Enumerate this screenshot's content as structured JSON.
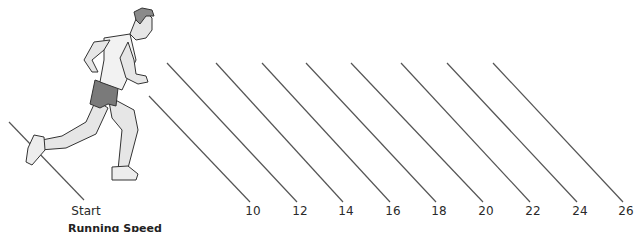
{
  "figure": {
    "caption": "Running Speed",
    "start_label": "Start",
    "markers": [
      {
        "label": "10",
        "x": 253
      },
      {
        "label": "12",
        "x": 300
      },
      {
        "label": "14",
        "x": 346
      },
      {
        "label": "16",
        "x": 393
      },
      {
        "label": "18",
        "x": 439
      },
      {
        "label": "20",
        "x": 486
      },
      {
        "label": "22",
        "x": 533
      },
      {
        "label": "24",
        "x": 580
      },
      {
        "label": "26",
        "x": 626
      }
    ],
    "line_color": "#555555",
    "figure_fill": "#e6e6e6",
    "shorts_fill": "#7a7a7a"
  }
}
